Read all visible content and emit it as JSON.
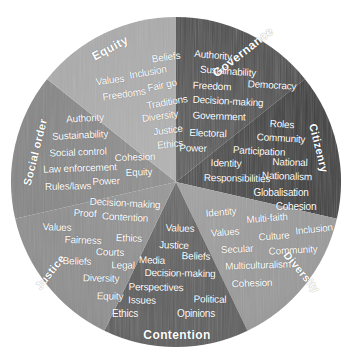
{
  "figure": {
    "name": "citizenship-concept-wheel",
    "shape": "circle",
    "center": [
      176,
      182
    ],
    "radius": 165,
    "background": "#ffffff"
  },
  "chart_data": {
    "type": "pie",
    "title": "",
    "xlabel": "",
    "ylabel": "",
    "legend_position": "none",
    "grid": false,
    "categories": [
      "Governance",
      "Citizenry",
      "Diversity",
      "Contention",
      "Justice",
      "Social order",
      "Equity"
    ],
    "values": [
      51.4,
      51.4,
      51.4,
      51.4,
      51.4,
      51.4,
      51.4
    ],
    "slice_colors": [
      "#4e4e4e",
      "#3b3b3b",
      "#9a9a9a",
      "#5c5c5c",
      "#8e8e8e",
      "#868686",
      "#ababab"
    ]
  },
  "sectors": [
    {
      "label": "Governance",
      "color": "#4e4e4e",
      "start_angle": 0,
      "end_angle": 51.4,
      "words": [
        "Authority",
        "Sustainability",
        "Freedom",
        "Democracy",
        "Decision-making",
        "Government",
        "Electoral",
        "Power"
      ]
    },
    {
      "label": "Citizenry",
      "color": "#3b3b3b",
      "start_angle": 51.4,
      "end_angle": 102.9,
      "words": [
        "Roles",
        "Community",
        "Participation",
        "Identity",
        "National",
        "Responsibilities",
        "Nationalism",
        "Globalisation",
        "Cohesion"
      ]
    },
    {
      "label": "Diversity",
      "color": "#9a9a9a",
      "start_angle": 102.9,
      "end_angle": 154.3,
      "words": [
        "Identity",
        "Multi-faith",
        "Values",
        "Inclusion",
        "Culture",
        "Secular",
        "Community",
        "Multiculturalism",
        "Cohesion"
      ]
    },
    {
      "label": "Contention",
      "color": "#5c5c5c",
      "start_angle": 154.3,
      "end_angle": 205.7,
      "words": [
        "Values",
        "Justice",
        "Beliefs",
        "Media",
        "Decision-making",
        "Perspectives",
        "Issues",
        "Political",
        "Ethics",
        "Opinions"
      ]
    },
    {
      "label": "Justice",
      "color": "#8e8e8e",
      "start_angle": 205.7,
      "end_angle": 257.1,
      "words": [
        "Decision-making",
        "Proof",
        "Contention",
        "Values",
        "Fairness",
        "Ethics",
        "Courts",
        "Beliefs",
        "Legal",
        "Diversity",
        "Equity"
      ]
    },
    {
      "label": "Social order",
      "color": "#868686",
      "start_angle": 257.1,
      "end_angle": 308.6,
      "words": [
        "Authority",
        "Sustainability",
        "Social control",
        "Cohesion",
        "Law enforcement",
        "Equity",
        "Power",
        "Rules/laws"
      ]
    },
    {
      "label": "Equity",
      "color": "#ababab",
      "start_angle": 308.6,
      "end_angle": 360,
      "words": [
        "Beliefs",
        "Inclusion",
        "Values",
        "Fair go",
        "Freedoms",
        "Traditions",
        "Diversity",
        "Justice",
        "Ethics"
      ]
    }
  ],
  "sector_labels": [
    {
      "text": "Governance",
      "x": 243,
      "y": 52,
      "rotate": -38,
      "size": 12
    },
    {
      "text": "Citizenry",
      "x": 319,
      "y": 148,
      "rotate": 76,
      "size": 11
    },
    {
      "text": "Diversity",
      "x": 302,
      "y": 272,
      "rotate": 50,
      "size": 11
    },
    {
      "text": "Contention",
      "x": 177,
      "y": 335,
      "rotate": 0,
      "size": 12
    },
    {
      "text": "Justice",
      "x": 50,
      "y": 272,
      "rotate": -52,
      "size": 11
    },
    {
      "text": "Social order",
      "x": 35,
      "y": 152,
      "rotate": -76,
      "size": 11
    },
    {
      "text": "Equity",
      "x": 110,
      "y": 48,
      "rotate": -28,
      "size": 12
    }
  ],
  "words_placed": [
    {
      "text": "Beliefs",
      "x": 166,
      "y": 57,
      "rotate": -8,
      "size": 10,
      "sector": "Equity"
    },
    {
      "text": "Inclusion",
      "x": 148,
      "y": 72,
      "rotate": -10,
      "size": 10,
      "sector": "Equity"
    },
    {
      "text": "Values",
      "x": 110,
      "y": 80,
      "rotate": -7,
      "size": 10,
      "sector": "Equity"
    },
    {
      "text": "Fair go",
      "x": 162,
      "y": 85,
      "rotate": -12,
      "size": 10,
      "sector": "Equity"
    },
    {
      "text": "Freedoms",
      "x": 124,
      "y": 94,
      "rotate": -8,
      "size": 10,
      "sector": "Equity"
    },
    {
      "text": "Traditions",
      "x": 167,
      "y": 102,
      "rotate": -10,
      "size": 10,
      "sector": "Equity"
    },
    {
      "text": "Diversity",
      "x": 160,
      "y": 116,
      "rotate": -8,
      "size": 10,
      "sector": "Equity"
    },
    {
      "text": "Justice",
      "x": 168,
      "y": 130,
      "rotate": -7,
      "size": 10,
      "sector": "Equity"
    },
    {
      "text": "Ethics",
      "x": 170,
      "y": 144,
      "rotate": -6,
      "size": 10,
      "sector": "Equity"
    },
    {
      "text": "Authority",
      "x": 213,
      "y": 55,
      "rotate": 5,
      "size": 10,
      "sector": "Governance"
    },
    {
      "text": "Sustainability",
      "x": 228,
      "y": 71,
      "rotate": 4,
      "size": 10,
      "sector": "Governance"
    },
    {
      "text": "Freedom",
      "x": 212,
      "y": 86,
      "rotate": 3,
      "size": 10,
      "sector": "Governance"
    },
    {
      "text": "Democracy",
      "x": 272,
      "y": 85,
      "rotate": 3,
      "size": 10,
      "sector": "Governance"
    },
    {
      "text": "Decision-making",
      "x": 228,
      "y": 101,
      "rotate": 3,
      "size": 10,
      "sector": "Governance"
    },
    {
      "text": "Government",
      "x": 219,
      "y": 116,
      "rotate": 2,
      "size": 10,
      "sector": "Governance"
    },
    {
      "text": "Electoral",
      "x": 208,
      "y": 133,
      "rotate": 2,
      "size": 10,
      "sector": "Governance"
    },
    {
      "text": "Power",
      "x": 193,
      "y": 148,
      "rotate": 1,
      "size": 10,
      "sector": "Governance"
    },
    {
      "text": "Roles",
      "x": 282,
      "y": 124,
      "rotate": 4,
      "size": 10,
      "sector": "Citizenry"
    },
    {
      "text": "Community",
      "x": 281,
      "y": 138,
      "rotate": 3,
      "size": 10,
      "sector": "Citizenry"
    },
    {
      "text": "Participation",
      "x": 259,
      "y": 151,
      "rotate": 3,
      "size": 10,
      "sector": "Citizenry"
    },
    {
      "text": "Identity",
      "x": 226,
      "y": 163,
      "rotate": 2,
      "size": 10,
      "sector": "Citizenry"
    },
    {
      "text": "National",
      "x": 290,
      "y": 162,
      "rotate": 2,
      "size": 10,
      "sector": "Citizenry"
    },
    {
      "text": "Nationalism",
      "x": 287,
      "y": 176,
      "rotate": 2,
      "size": 10,
      "sector": "Citizenry"
    },
    {
      "text": "Responsibilities",
      "x": 237,
      "y": 178,
      "rotate": 1,
      "size": 10,
      "sector": "Citizenry"
    },
    {
      "text": "Globalisation",
      "x": 281,
      "y": 192,
      "rotate": 0,
      "size": 10,
      "sector": "Citizenry"
    },
    {
      "text": "Cohesion",
      "x": 296,
      "y": 206,
      "rotate": 0,
      "size": 10,
      "sector": "Citizenry"
    },
    {
      "text": "Identity",
      "x": 221,
      "y": 212,
      "rotate": -5,
      "size": 10,
      "sector": "Diversity"
    },
    {
      "text": "Multi-faith",
      "x": 267,
      "y": 218,
      "rotate": -5,
      "size": 10,
      "sector": "Diversity"
    },
    {
      "text": "Values",
      "x": 225,
      "y": 232,
      "rotate": -4,
      "size": 10,
      "sector": "Diversity"
    },
    {
      "text": "Culture",
      "x": 274,
      "y": 236,
      "rotate": -4,
      "size": 10,
      "sector": "Diversity"
    },
    {
      "text": "Inclusion",
      "x": 314,
      "y": 229,
      "rotate": -6,
      "size": 10,
      "sector": "Diversity"
    },
    {
      "text": "Secular",
      "x": 237,
      "y": 249,
      "rotate": -3,
      "size": 10,
      "sector": "Diversity"
    },
    {
      "text": "Community",
      "x": 293,
      "y": 250,
      "rotate": -3,
      "size": 10,
      "sector": "Diversity"
    },
    {
      "text": "Multiculturalism",
      "x": 258,
      "y": 265,
      "rotate": -2,
      "size": 10,
      "sector": "Diversity"
    },
    {
      "text": "Cohesion",
      "x": 252,
      "y": 283,
      "rotate": -2,
      "size": 10,
      "sector": "Diversity"
    },
    {
      "text": "Values",
      "x": 180,
      "y": 228,
      "rotate": 2,
      "size": 10,
      "sector": "Contention"
    },
    {
      "text": "Justice",
      "x": 174,
      "y": 245,
      "rotate": 2,
      "size": 10,
      "sector": "Contention"
    },
    {
      "text": "Beliefs",
      "x": 196,
      "y": 256,
      "rotate": 2,
      "size": 10,
      "sector": "Contention"
    },
    {
      "text": "Media",
      "x": 152,
      "y": 260,
      "rotate": 2,
      "size": 10,
      "sector": "Contention"
    },
    {
      "text": "Decision-making",
      "x": 180,
      "y": 273,
      "rotate": 1,
      "size": 10,
      "sector": "Contention"
    },
    {
      "text": "Perspectives",
      "x": 156,
      "y": 287,
      "rotate": 1,
      "size": 10,
      "sector": "Contention"
    },
    {
      "text": "Issues",
      "x": 142,
      "y": 300,
      "rotate": 1,
      "size": 10,
      "sector": "Contention"
    },
    {
      "text": "Political",
      "x": 210,
      "y": 299,
      "rotate": 1,
      "size": 10,
      "sector": "Contention"
    },
    {
      "text": "Ethics",
      "x": 125,
      "y": 313,
      "rotate": 0,
      "size": 10,
      "sector": "Contention"
    },
    {
      "text": "Opinions",
      "x": 196,
      "y": 313,
      "rotate": 0,
      "size": 10,
      "sector": "Contention"
    },
    {
      "text": "Decision-making",
      "x": 125,
      "y": 203,
      "rotate": 3,
      "size": 10,
      "sector": "Justice"
    },
    {
      "text": "Proof",
      "x": 85,
      "y": 213,
      "rotate": 3,
      "size": 10,
      "sector": "Justice"
    },
    {
      "text": "Contention",
      "x": 125,
      "y": 217,
      "rotate": 3,
      "size": 10,
      "sector": "Justice"
    },
    {
      "text": "Values",
      "x": 57,
      "y": 227,
      "rotate": 2,
      "size": 10,
      "sector": "Justice"
    },
    {
      "text": "Fairness",
      "x": 83,
      "y": 240,
      "rotate": 2,
      "size": 10,
      "sector": "Justice"
    },
    {
      "text": "Ethics",
      "x": 129,
      "y": 238,
      "rotate": 2,
      "size": 10,
      "sector": "Justice"
    },
    {
      "text": "Courts",
      "x": 110,
      "y": 252,
      "rotate": 2,
      "size": 10,
      "sector": "Justice"
    },
    {
      "text": "Beliefs",
      "x": 77,
      "y": 261,
      "rotate": 2,
      "size": 10,
      "sector": "Justice"
    },
    {
      "text": "Legal",
      "x": 123,
      "y": 265,
      "rotate": 1,
      "size": 10,
      "sector": "Justice"
    },
    {
      "text": "Diversity",
      "x": 101,
      "y": 278,
      "rotate": 1,
      "size": 10,
      "sector": "Justice"
    },
    {
      "text": "Equity",
      "x": 110,
      "y": 296,
      "rotate": 1,
      "size": 10,
      "sector": "Justice"
    },
    {
      "text": "Authority",
      "x": 85,
      "y": 118,
      "rotate": -3,
      "size": 10,
      "sector": "Social order"
    },
    {
      "text": "Sustainability",
      "x": 80,
      "y": 135,
      "rotate": -3,
      "size": 10,
      "sector": "Social order"
    },
    {
      "text": "Social control",
      "x": 78,
      "y": 152,
      "rotate": -2,
      "size": 10,
      "sector": "Social order"
    },
    {
      "text": "Cohesion",
      "x": 135,
      "y": 157,
      "rotate": -2,
      "size": 10,
      "sector": "Social order"
    },
    {
      "text": "Law enforcement",
      "x": 80,
      "y": 168,
      "rotate": -2,
      "size": 10,
      "sector": "Social order"
    },
    {
      "text": "Equity",
      "x": 139,
      "y": 172,
      "rotate": -2,
      "size": 10,
      "sector": "Social order"
    },
    {
      "text": "Power",
      "x": 106,
      "y": 181,
      "rotate": -2,
      "size": 10,
      "sector": "Social order"
    },
    {
      "text": "Rules/laws",
      "x": 68,
      "y": 186,
      "rotate": -1,
      "size": 10,
      "sector": "Social order"
    }
  ]
}
